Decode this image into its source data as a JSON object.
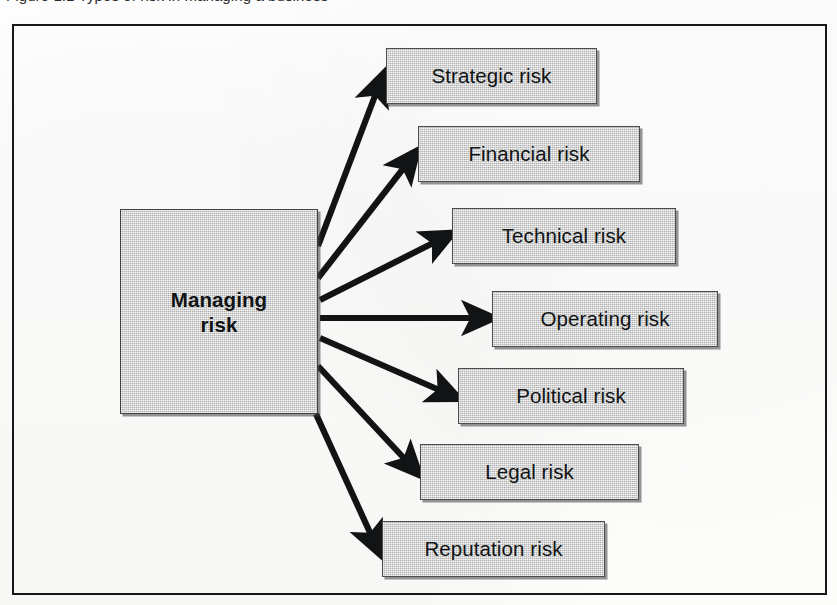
{
  "figure": {
    "caption_remnant": "Figure 1.1   Types of risk in managing a business",
    "frame_border_color": "#16181a",
    "page_background": "#ffffff"
  },
  "diagram": {
    "type": "fan-out-relationship",
    "center": {
      "label_line1": "Managing",
      "label_line2": "risk",
      "full_label": "Managing risk",
      "fill_color": "#c3c4c3",
      "border_color": "#3f4142",
      "text_color": "#111315"
    },
    "branches": [
      {
        "label": "Strategic risk",
        "x": 386,
        "y": 48,
        "w": 211
      },
      {
        "label": "Financial risk",
        "x": 418,
        "y": 126,
        "w": 222
      },
      {
        "label": "Technical risk",
        "x": 452,
        "y": 208,
        "w": 224
      },
      {
        "label": "Operating risk",
        "x": 492,
        "y": 291,
        "w": 226
      },
      {
        "label": "Political risk",
        "x": 458,
        "y": 368,
        "w": 226
      },
      {
        "label": "Legal risk",
        "x": 420,
        "y": 444,
        "w": 219
      },
      {
        "label": "Reputation risk",
        "x": 382,
        "y": 521,
        "w": 223
      }
    ],
    "arrow_color": "#111315",
    "arrow_count": 7,
    "node_fill_color": "#c3c4c3",
    "node_border_color": "#4a4c4d"
  }
}
